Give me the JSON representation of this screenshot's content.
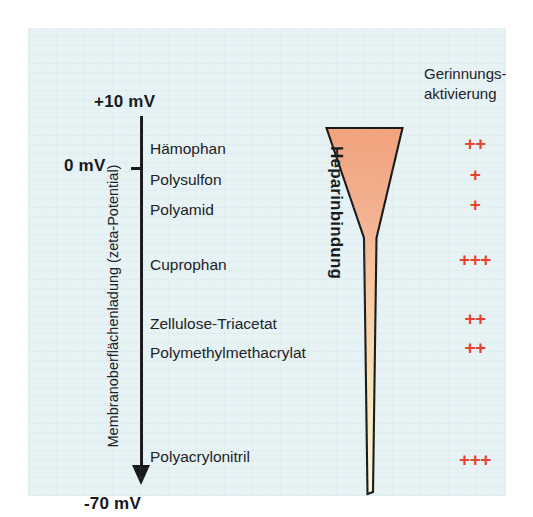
{
  "figure": {
    "background_color": "#e6f2f4",
    "axis_color": "#16191b",
    "plus_color": "#e8402a",
    "wedge_top_color": "#f4a882",
    "wedge_bottom_color": "#fbf0c4"
  },
  "axis": {
    "caption": "Membranoberflächenladung (zeta-Potential)",
    "top_value": "+10 mV",
    "zero_value": "0 mV",
    "bottom_value": "-70 mV"
  },
  "wedge": {
    "caption": "Heparinbindung"
  },
  "coagulation": {
    "header_line1": "Gerinnungs-",
    "header_line2": "aktivierung"
  },
  "rows": [
    {
      "membrane": "Hämophan",
      "activation": "++",
      "y": 112,
      "plus_y": 105
    },
    {
      "membrane": "Polysulfon",
      "activation": "+",
      "y": 143,
      "plus_y": 136
    },
    {
      "membrane": "Polyamid",
      "activation": "+",
      "y": 173,
      "plus_y": 166
    },
    {
      "membrane": "Cuprophan",
      "activation": "+++",
      "y": 228,
      "plus_y": 221
    },
    {
      "membrane": "Zellulose-Triacetat",
      "activation": "++",
      "y": 287,
      "plus_y": 280
    },
    {
      "membrane": "Polymethylmethacrylat",
      "activation": "++",
      "y": 316,
      "plus_y": 309
    },
    {
      "membrane": "Polyacrylonitril",
      "activation": "+++",
      "y": 420,
      "plus_y": 421
    }
  ],
  "chart_data": {
    "type": "diagram",
    "ylabel": "Membranoberflächenladung (zeta-Potential)",
    "ylim": [
      "+10 mV",
      "-70 mV"
    ],
    "y_ticks": [
      "+10 mV",
      "0 mV",
      "-70 mV"
    ],
    "categories": [
      "Hämophan",
      "Polysulfon",
      "Polyamid",
      "Cuprophan",
      "Zellulose-Triacetat",
      "Polymethylmethacrylat",
      "Polyacrylonitril"
    ],
    "series": [
      {
        "name": "Gerinnungsaktivierung",
        "values": [
          "++",
          "+",
          "+",
          "+++",
          "++",
          "++",
          "+++"
        ]
      }
    ],
    "annotations": [
      "Heparinbindung"
    ],
    "grid": false,
    "legend": "none"
  }
}
